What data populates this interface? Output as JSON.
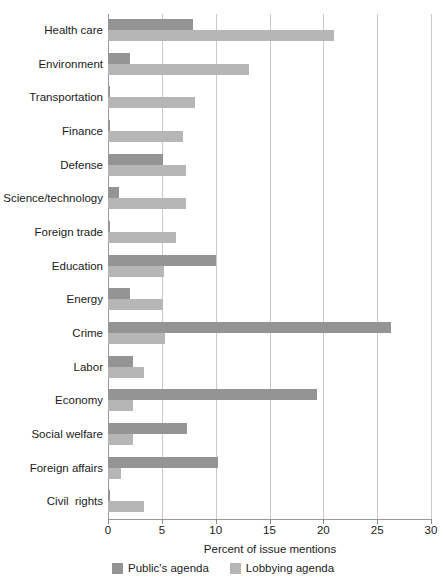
{
  "chart_data": {
    "type": "bar",
    "orientation": "horizontal",
    "title": "",
    "xlabel": "Percent of issue mentions",
    "ylabel": "",
    "xlim": [
      0,
      30
    ],
    "xticks": [
      0,
      5,
      10,
      15,
      20,
      25,
      30
    ],
    "grid": true,
    "legend_position": "bottom-left",
    "categories": [
      "Health care",
      "Environment",
      "Transportation",
      "Finance",
      "Defense",
      "Science/technology",
      "Foreign trade",
      "Education",
      "Energy",
      "Crime",
      "Labor",
      "Economy",
      "Social welfare",
      "Foreign affairs",
      "Civil  rights"
    ],
    "series": [
      {
        "name": "Public's agenda",
        "color": "#949494",
        "values": [
          7.9,
          2.0,
          0.15,
          0.15,
          5.1,
          1.0,
          0.15,
          10.0,
          2.0,
          26.3,
          2.3,
          19.4,
          7.3,
          10.2,
          0.15
        ]
      },
      {
        "name": "Lobbying agenda",
        "color": "#b6b6b6",
        "values": [
          21.0,
          13.1,
          8.1,
          7.0,
          7.2,
          7.2,
          6.3,
          5.2,
          5.1,
          5.3,
          3.3,
          2.3,
          2.3,
          1.2,
          3.3
        ]
      }
    ]
  },
  "axis": {
    "tick_labels": [
      "0",
      "5",
      "10",
      "15",
      "20",
      "25",
      "30"
    ],
    "title": "Percent of issue mentions"
  },
  "legend": {
    "items": [
      {
        "label": "Public's agenda",
        "color": "#949494"
      },
      {
        "label": "Lobbying agenda",
        "color": "#b6b6b6"
      }
    ]
  },
  "colors": {
    "public_agenda": "#949494",
    "lobbying_agenda": "#b6b6b6",
    "gridline": "#c9c9c9",
    "axis": "#9a9a9a",
    "text": "#1b1b1b",
    "background": "#ffffff"
  }
}
